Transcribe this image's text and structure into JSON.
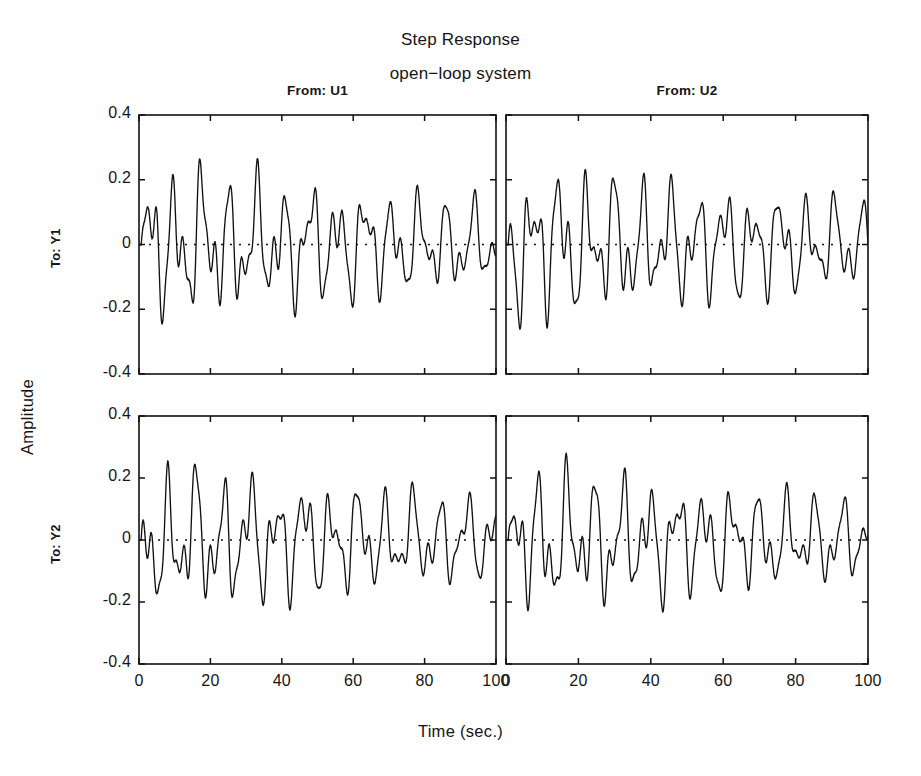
{
  "figure": {
    "title": "Step Response",
    "subtitle": "open−loop system",
    "xlabel": "Time (sec.)",
    "ylabel": "Amplitude",
    "line_color": "#111111",
    "background": "#ffffff"
  },
  "column_headers": [
    "From: U1",
    "From: U2"
  ],
  "row_labels": [
    "To: Y1",
    "To: Y2"
  ],
  "axes": {
    "xticks": [
      0,
      20,
      40,
      60,
      80,
      100
    ],
    "xtick_labels": [
      "0",
      "20",
      "40",
      "60",
      "80",
      "100"
    ],
    "yticks": [
      0.4,
      0.2,
      0,
      -0.2,
      -0.4
    ],
    "ytick_labels": [
      "0.4",
      "0.2",
      "0",
      "-0.2",
      "-0.4"
    ],
    "xlim": [
      0,
      100
    ],
    "ylim": [
      -0.4,
      0.4
    ],
    "grid": false,
    "zero_reference_line": true
  },
  "chart_data": {
    "type": "line",
    "title": "Step Response",
    "subtitle": "open−loop system",
    "xlabel": "Time (sec.)",
    "ylabel": "Amplitude",
    "xlim": [
      0,
      100
    ],
    "ylim": [
      -0.4,
      0.4
    ],
    "grid": false,
    "legend": "none",
    "layout": "2x2 subplot grid (MATLAB step response matrix)",
    "subplots": [
      {
        "row": 0,
        "col": 0,
        "from": "U1",
        "to": "Y1",
        "description": "Lightly damped multi-mode oscillation with beating; initial transient overshoot to +0.27 then dip to -0.29, sustained oscillation roughly within +/-0.3 decaying slowly toward +/-0.2 envelope",
        "model": {
          "modes": [
            {
              "amplitude": 0.15,
              "period": 7.6,
              "phase": 0.0,
              "decay_tau": 180
            },
            {
              "amplitude": 0.105,
              "period": 4.05,
              "phase": 1.1,
              "decay_tau": 140
            },
            {
              "amplitude": 0.055,
              "period": 2.35,
              "phase": 2.4,
              "decay_tau": 110
            },
            {
              "amplitude": 0.03,
              "period": 15.4,
              "phase": 0.6,
              "decay_tau": 95
            }
          ],
          "offset": 0.0,
          "onset": 0.6
        },
        "approx_peak_max": 0.31,
        "approx_peak_min": -0.3
      },
      {
        "row": 0,
        "col": 1,
        "from": "U2",
        "to": "Y1",
        "description": "Similar sustained oscillation, peaks near +0.30, troughs near -0.30, slightly different phasing and a denser ripple after t=70",
        "model": {
          "modes": [
            {
              "amplitude": 0.145,
              "period": 7.6,
              "phase": 2.3,
              "decay_tau": 200
            },
            {
              "amplitude": 0.11,
              "period": 4.05,
              "phase": 0.2,
              "decay_tau": 150
            },
            {
              "amplitude": 0.052,
              "period": 2.35,
              "phase": 1.3,
              "decay_tau": 120
            },
            {
              "amplitude": 0.026,
              "period": 15.4,
              "phase": 2.9,
              "decay_tau": 100
            }
          ],
          "offset": 0.0,
          "onset": 0.6
        },
        "approx_peak_max": 0.3,
        "approx_peak_min": -0.3
      },
      {
        "row": 1,
        "col": 0,
        "from": "U1",
        "to": "Y2",
        "description": "Oscillation with pronounced beating envelope; maxima around +0.30 early, settling toward +0.25, minima around -0.29",
        "model": {
          "modes": [
            {
              "amplitude": 0.15,
              "period": 7.6,
              "phase": 1.5,
              "decay_tau": 190
            },
            {
              "amplitude": 0.1,
              "period": 4.05,
              "phase": 2.7,
              "decay_tau": 150
            },
            {
              "amplitude": 0.05,
              "period": 2.35,
              "phase": 0.4,
              "decay_tau": 115
            },
            {
              "amplitude": 0.032,
              "period": 15.4,
              "phase": 1.9,
              "decay_tau": 90
            }
          ],
          "offset": 0.0,
          "onset": 0.6
        },
        "approx_peak_max": 0.3,
        "approx_peak_min": -0.3
      },
      {
        "row": 1,
        "col": 1,
        "from": "U2",
        "to": "Y2",
        "description": "Sustained oscillation with clear beat pattern, peaks approximately +0.31 and troughs -0.30, increasing ripple density toward t=100",
        "model": {
          "modes": [
            {
              "amplitude": 0.148,
              "period": 7.6,
              "phase": 0.7,
              "decay_tau": 185
            },
            {
              "amplitude": 0.102,
              "period": 4.05,
              "phase": 1.8,
              "decay_tau": 145
            },
            {
              "amplitude": 0.054,
              "period": 2.35,
              "phase": 3.0,
              "decay_tau": 118
            },
            {
              "amplitude": 0.028,
              "period": 15.4,
              "phase": 0.1,
              "decay_tau": 95
            }
          ],
          "offset": 0.0,
          "onset": 0.6
        },
        "approx_peak_max": 0.31,
        "approx_peak_min": -0.3
      }
    ]
  },
  "geometry": {
    "panels": [
      {
        "x": 139,
        "y": 115,
        "w": 357,
        "h": 259
      },
      {
        "x": 506,
        "y": 115,
        "w": 362,
        "h": 259
      },
      {
        "x": 139,
        "y": 416,
        "w": 357,
        "h": 248
      },
      {
        "x": 506,
        "y": 416,
        "w": 362,
        "h": 248
      }
    ]
  }
}
